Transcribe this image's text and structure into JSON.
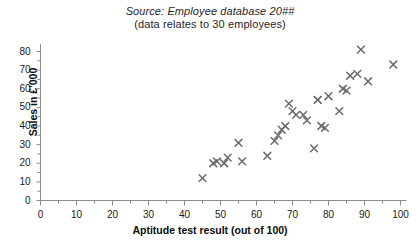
{
  "caption": {
    "source_line": "Source: Employee database 20##",
    "detail_line": "(data relates to 30 employees)"
  },
  "axes": {
    "y_title": "Sales in £'000",
    "x_title": "Aptitude test result (out of 100)",
    "y_ticks": [
      "0",
      "10",
      "20",
      "30",
      "40",
      "50",
      "60",
      "70",
      "80"
    ],
    "x_ticks": [
      "0",
      "10",
      "20",
      "30",
      "40",
      "50",
      "60",
      "70",
      "80",
      "90",
      "100"
    ],
    "origin_label": "0"
  },
  "style": {
    "marker_color": "#6b6b6b",
    "axis_color": "#8c8c8c",
    "text_color": "#1a1a1a",
    "background": "#ffffff"
  },
  "chart_data": {
    "type": "scatter",
    "title": "",
    "subtitle": "Source: Employee database 20##",
    "annotation": "(data relates to 30 employees)",
    "xlabel": "Aptitude test result (out of 100)",
    "ylabel": "Sales in £'000",
    "xlim": [
      0,
      100
    ],
    "ylim": [
      0,
      85
    ],
    "xticks": [
      0,
      10,
      20,
      30,
      40,
      50,
      60,
      70,
      80,
      90,
      100
    ],
    "yticks": [
      0,
      10,
      20,
      30,
      40,
      50,
      60,
      70,
      80
    ],
    "grid": false,
    "legend": false,
    "marker": "x",
    "n_points": 30,
    "points": [
      {
        "x": 45,
        "y": 12
      },
      {
        "x": 48,
        "y": 20
      },
      {
        "x": 49,
        "y": 21
      },
      {
        "x": 51,
        "y": 20
      },
      {
        "x": 52,
        "y": 23
      },
      {
        "x": 55,
        "y": 31
      },
      {
        "x": 56,
        "y": 21
      },
      {
        "x": 63,
        "y": 24
      },
      {
        "x": 65,
        "y": 32
      },
      {
        "x": 66,
        "y": 35
      },
      {
        "x": 67,
        "y": 38
      },
      {
        "x": 68,
        "y": 40
      },
      {
        "x": 69,
        "y": 52
      },
      {
        "x": 70,
        "y": 48
      },
      {
        "x": 71,
        "y": 46
      },
      {
        "x": 73,
        "y": 46
      },
      {
        "x": 74,
        "y": 43
      },
      {
        "x": 76,
        "y": 28
      },
      {
        "x": 77,
        "y": 54
      },
      {
        "x": 77,
        "y": 54
      },
      {
        "x": 78,
        "y": 40
      },
      {
        "x": 79,
        "y": 39
      },
      {
        "x": 80,
        "y": 56
      },
      {
        "x": 83,
        "y": 48
      },
      {
        "x": 84,
        "y": 60
      },
      {
        "x": 85,
        "y": 59
      },
      {
        "x": 86,
        "y": 67
      },
      {
        "x": 88,
        "y": 68
      },
      {
        "x": 89,
        "y": 81
      },
      {
        "x": 91,
        "y": 64
      },
      {
        "x": 98,
        "y": 73
      }
    ]
  }
}
